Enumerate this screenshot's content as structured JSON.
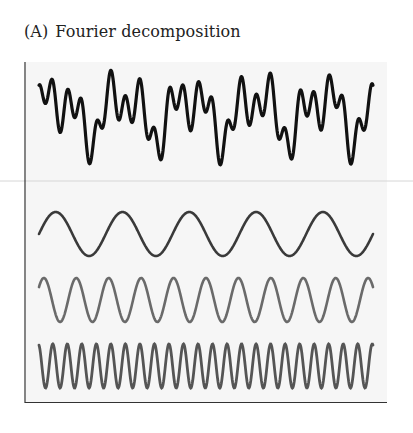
{
  "figure": {
    "panel_label": "(A)",
    "title": "Fourier decomposition"
  },
  "chart_data": {
    "type": "line",
    "title": "Fourier decomposition",
    "panel": "A",
    "xlabel": "",
    "ylabel": "",
    "grid": false,
    "axes": {
      "left": true,
      "bottom": true,
      "ticks": false
    },
    "x_range": [
      0,
      1
    ],
    "series": [
      {
        "name": "complex waveform (sum)",
        "role": "composite",
        "color": "#111111",
        "components": [
          0,
          1,
          2
        ]
      },
      {
        "name": "component 1 (fundamental)",
        "cycles": 5.0,
        "amplitude": 1.0,
        "phase": 0,
        "color": "#3a3a3a"
      },
      {
        "name": "component 2",
        "cycles": 10.3,
        "amplitude": 1.0,
        "phase": 0.1,
        "color": "#6a6a6a"
      },
      {
        "name": "component 3",
        "cycles": 23.0,
        "amplitude": 1.0,
        "phase": 0.3,
        "color": "#555555"
      }
    ]
  }
}
